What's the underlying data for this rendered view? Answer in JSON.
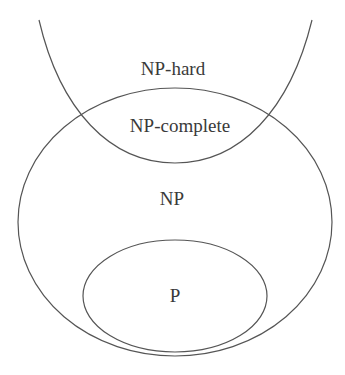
{
  "diagram": {
    "title": "",
    "stroke_color": "#555555",
    "text_color": "#3a3a3a",
    "labels": {
      "np_hard": "NP-hard",
      "np_complete": "NP-complete",
      "np": "NP",
      "p": "P"
    },
    "regions": [
      {
        "name": "NP-hard",
        "shape": "open U-curve"
      },
      {
        "name": "NP",
        "shape": "ellipse"
      },
      {
        "name": "P",
        "shape": "ellipse",
        "inside": "NP"
      },
      {
        "name": "NP-complete",
        "shape": "intersection",
        "of": [
          "NP-hard",
          "NP"
        ]
      }
    ]
  }
}
